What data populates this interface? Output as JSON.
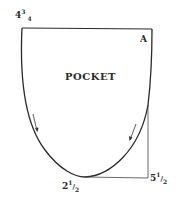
{
  "diagram": {
    "title": "POCKET",
    "point_label": "A",
    "measurements": {
      "top_left": {
        "whole": "4",
        "num": "3",
        "den": "4"
      },
      "bottom": {
        "whole": "2",
        "num": "1",
        "den": "2"
      },
      "bottom_right": {
        "whole": "5",
        "num": "1",
        "den": "2"
      }
    },
    "colors": {
      "line": "#2a2a2a",
      "background": "#ffffff"
    }
  }
}
